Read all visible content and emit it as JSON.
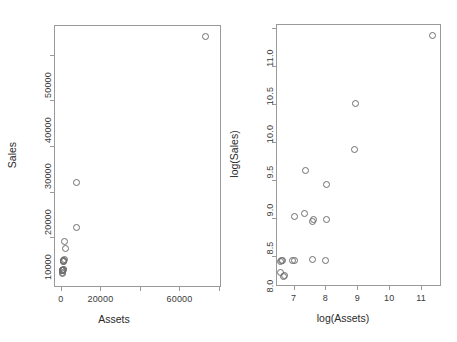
{
  "figure": {
    "background": "#ffffff",
    "point_color": "#6e6e6e",
    "frame_color": "#9a9a9a",
    "text_color": "#2b2b2b"
  },
  "chart_data": [
    {
      "type": "scatter",
      "panel": "left",
      "title": "",
      "xlabel": "Assets",
      "ylabel": "Sales",
      "xlim": [
        -3500,
        81000
      ],
      "ylim": [
        -900,
        56500
      ],
      "xticks": [
        0,
        20000,
        40000,
        60000,
        80000
      ],
      "xticklabels": [
        "0",
        "20000",
        "",
        "60000",
        ""
      ],
      "yticks": [
        10000,
        20000,
        30000,
        40000,
        50000
      ],
      "yticklabels": [
        "10000",
        "20000",
        "30000",
        "40000",
        "50000"
      ],
      "grid": false,
      "legend": "none",
      "marker": "open-circle",
      "x": [
        73000,
        8100,
        8000,
        1800,
        2200,
        2000,
        1500,
        1400,
        1300,
        1250,
        1150,
        1100,
        1050,
        980,
        950,
        900,
        820,
        780,
        760,
        740
      ],
      "y": [
        54000,
        22000,
        12200,
        9100,
        7600,
        5100,
        5000,
        4900,
        4750,
        4700,
        2900,
        2850,
        2800,
        2780,
        2750,
        2740,
        2730,
        2720,
        2300,
        2150
      ]
    },
    {
      "type": "scatter",
      "panel": "right",
      "title": "",
      "xlabel": "log(Assets)",
      "ylabel": "log(Sales)",
      "xlim": [
        6.45,
        11.62
      ],
      "ylim": [
        7.6,
        11.05
      ],
      "xticks": [
        7,
        8,
        9,
        10,
        11
      ],
      "xticklabels": [
        "7",
        "8",
        "9",
        "10",
        "11"
      ],
      "yticks": [
        8.0,
        8.5,
        9.0,
        9.5,
        10.0,
        10.5,
        11.0
      ],
      "yticklabels": [
        "8.0",
        "8.5",
        "9.0",
        "9.5",
        "10.0",
        "10.5",
        "11.0"
      ],
      "grid": false,
      "legend": "none",
      "marker": "open-circle",
      "x": [
        11.35,
        8.93,
        8.92,
        8.02,
        8.03,
        8.01,
        7.6,
        7.37,
        7.35,
        7.03,
        7.02,
        6.98,
        6.62,
        6.6,
        6.68,
        6.72,
        7.58,
        7.62,
        6.64,
        6.58
      ],
      "y": [
        10.9,
        10.0,
        9.4,
        8.93,
        8.48,
        7.93,
        7.95,
        9.12,
        8.55,
        8.52,
        7.94,
        7.93,
        7.93,
        7.78,
        7.72,
        7.74,
        8.45,
        8.47,
        7.93,
        7.92
      ]
    }
  ]
}
